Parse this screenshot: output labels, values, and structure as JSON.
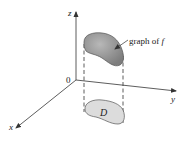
{
  "figure": {
    "axes": {
      "z_label": "z",
      "y_label": "y",
      "x_label": "x",
      "origin_label": "0"
    },
    "surface": {
      "annotation_prefix": "graph of ",
      "annotation_var": "f",
      "fill_color": "#8f8f8f"
    },
    "region": {
      "label": "D",
      "fill_color": "#dcdcdc"
    },
    "colors": {
      "axis": "#333333",
      "dashed": "#333333"
    }
  }
}
